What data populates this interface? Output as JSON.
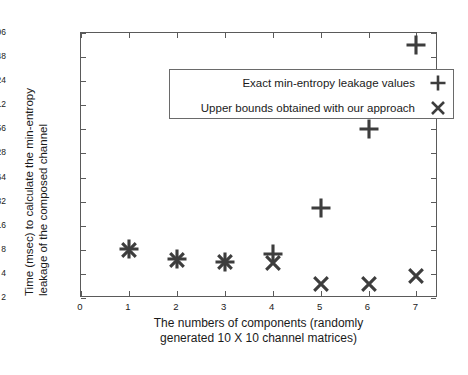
{
  "chart_data": {
    "type": "scatter",
    "title": "",
    "xlabel": "The numbers of components (randomly generated 10 X 10 channel matrices)",
    "xlabel_line1": "The numbers of components (randomly",
    "xlabel_line2": "generated 10 X 10 channel matrices)",
    "ylabel": "Time (msec) to calculate the min-entropy leakage of the composed channel",
    "ylabel_line1": "Time (msec) to calculate the min-entropy",
    "ylabel_line2": "leakage of the composed channel",
    "yscale": "log2",
    "ylim": [
      2,
      4096
    ],
    "xlim": [
      0,
      7.45
    ],
    "grid": false,
    "legend_position": "top-left-inside",
    "y_ticks": [
      2,
      4,
      8,
      16,
      32,
      64,
      128,
      256,
      512,
      1024,
      2048,
      4096
    ],
    "y_tick_labels": [
      "2",
      "4",
      "8",
      "16",
      "32",
      "64",
      "128",
      "256",
      "512",
      "1024",
      "2048",
      "4096"
    ],
    "x_ticks": [
      0,
      1,
      2,
      3,
      4,
      5,
      6,
      7
    ],
    "x_tick_labels": [
      "0",
      "1",
      "2",
      "3",
      "4",
      "5",
      "6",
      "7"
    ],
    "x": [
      1,
      2,
      3,
      4,
      5,
      6,
      7
    ],
    "series": [
      {
        "name": "Exact min-entropy leakage values",
        "marker": "plus",
        "color": "#3d3d3d",
        "values": [
          8.2,
          6.1,
          5.7,
          7.0,
          27,
          260,
          2900
        ]
      },
      {
        "name": "Upper bounds obtained with our approach",
        "marker": "cross",
        "color": "#3d3d3d",
        "values": [
          8.0,
          6.0,
          5.6,
          5.4,
          3.0,
          3.0,
          3.8
        ]
      }
    ]
  },
  "legend": {
    "items": [
      {
        "label": "Exact min-entropy leakage values",
        "marker": "plus"
      },
      {
        "label": "Upper bounds obtained with our approach",
        "marker": "cross"
      }
    ]
  },
  "colors": {
    "marker": "#3d3d3d",
    "axis": "#5a5a5a",
    "text": "#1a1a1a",
    "background": "#ffffff"
  }
}
